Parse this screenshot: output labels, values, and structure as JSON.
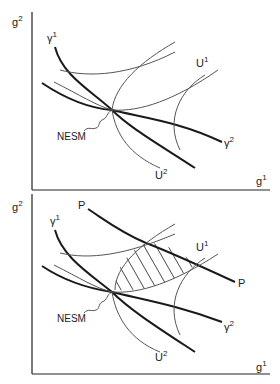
{
  "panels": [
    {
      "id": "top",
      "axes": {
        "y_label": "g",
        "y_sup": "2",
        "x_label": "g",
        "x_sup": "1"
      },
      "curves": {
        "gamma1": {
          "label": "γ",
          "sup": "1"
        },
        "gamma2": {
          "label": "γ",
          "sup": "2"
        },
        "U1": {
          "label": "U",
          "sup": "1"
        },
        "U2": {
          "label": "U",
          "sup": "2"
        }
      },
      "point_label": "NESM"
    },
    {
      "id": "bottom",
      "axes": {
        "y_label": "g",
        "y_sup": "2",
        "x_label": "g",
        "x_sup": "1"
      },
      "curves": {
        "gamma1": {
          "label": "γ",
          "sup": "1"
        },
        "gamma2": {
          "label": "γ",
          "sup": "2"
        },
        "U1": {
          "label": "U",
          "sup": "1"
        },
        "U2": {
          "label": "U",
          "sup": "2"
        },
        "P_left": {
          "label": "P"
        },
        "P_right": {
          "label": "P"
        }
      },
      "point_label": "NESM",
      "shaded_region": "hatched lens between indifference curves above NESM"
    }
  ],
  "colors": {
    "thick_line": "#1a1a1a",
    "thin_line": "#555555",
    "axis": "#222222"
  }
}
